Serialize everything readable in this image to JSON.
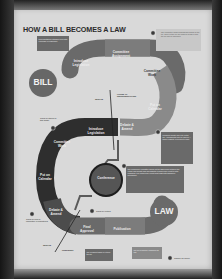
{
  "poster": {
    "title": "HOW A BILL BECOMES A LAW",
    "start_label": "BILL",
    "end_label": "LAW",
    "chamber_labels": {
      "senate_top": "SENATE",
      "house": "HOUSE OF REPRESENTATIVES",
      "senate_bottom": "SENATE",
      "president": "PRESIDENT"
    },
    "house_path": [
      {
        "label": "Introduce Legislation"
      },
      {
        "label": "Committee Assignment"
      },
      {
        "label": "Committee Work"
      },
      {
        "label": "Put on Calendar"
      },
      {
        "label": "Debate & Amend"
      }
    ],
    "senate_path": [
      {
        "label": "Introduce Legislation"
      },
      {
        "label": "Committee Work"
      },
      {
        "label": "Put on Calendar"
      },
      {
        "label": "Debate & Amend"
      }
    ],
    "conference": {
      "label": "Conference"
    },
    "final_path": [
      {
        "label": "Final Approval"
      },
      {
        "label": "Publication"
      }
    ],
    "notes": {
      "intro_note": "Representatives introduce a bill with a sponsor or cosponsor.",
      "committee_note": "The committee holds hearings and marks up the bill. There is time for the public to weigh in and the bill may be amended.",
      "debate_note": "Members debate and vote on the bill. Amendments may be offered. A simple majority is needed to pass.",
      "conference_note": "The conference committee works out the differences between the House and Senate bills and submits a conference report to both chambers. The conference report must pass both chambers unchanged.",
      "senate_hold_note": "Could be stalled in this phase",
      "senate_debate_note": "Could be held in committee or filibustered",
      "veto_note": "Could be vetoed",
      "president_note": "The president signs or vetoes the bill.",
      "publication_note": "The bill is officially published as law."
    },
    "legend": {
      "label": "Chance for failure"
    }
  },
  "colors": {
    "paper": "#d9d9d9",
    "dark_band": "#2e2e2e",
    "mid_band": "#6e6e6e",
    "light_band": "#8a8a8a",
    "note_box": "#6a6a6a",
    "circle": "#676767"
  }
}
